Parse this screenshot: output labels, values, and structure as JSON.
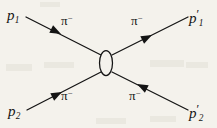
{
  "figure": {
    "kind": "feynman-scattering-diagram",
    "background_color": "#f4f2ec",
    "line_color": "#141414",
    "text_color": "#141414"
  },
  "vertex": {
    "name": "interaction-blob",
    "shape": "ellipse",
    "cx": 106,
    "cy": 63,
    "rx": 6.5,
    "ry": 12.5,
    "fill": "#f4f2ec",
    "stroke": "#141414"
  },
  "momenta": [
    {
      "id": "p1",
      "base": "p",
      "sub": "1",
      "prime": "",
      "position": "upper-left"
    },
    {
      "id": "p1prime",
      "base": "p",
      "sub": "1",
      "prime": "′",
      "position": "upper-right"
    },
    {
      "id": "p2",
      "base": "p",
      "sub": "2",
      "prime": "",
      "position": "lower-left"
    },
    {
      "id": "p2prime",
      "base": "p",
      "sub": "2",
      "prime": "′",
      "position": "lower-right"
    }
  ],
  "particles": [
    {
      "id": "pi-upper-left",
      "symbol": "π",
      "charge": "−",
      "leg": "upper-left",
      "arrow_direction": "toward-vertex"
    },
    {
      "id": "pi-upper-right",
      "symbol": "π",
      "charge": "−",
      "leg": "upper-right",
      "arrow_direction": "away-from-vertex"
    },
    {
      "id": "pi-lower-left",
      "symbol": "π",
      "charge": "−",
      "leg": "lower-left",
      "arrow_direction": "toward-vertex"
    },
    {
      "id": "pi-lower-right",
      "symbol": "π",
      "charge": "−",
      "leg": "lower-right",
      "arrow_direction": "toward-vertex"
    }
  ],
  "legs": [
    {
      "id": "leg-upper-left",
      "x1": 26,
      "y1": 17,
      "x2": 101,
      "y2": 55,
      "arrow_at_x": 57,
      "arrow_at_y": 32,
      "arrow_angle_deg": 27
    },
    {
      "id": "leg-upper-right",
      "x1": 112,
      "y1": 55,
      "x2": 188,
      "y2": 17,
      "arrow_at_x": 147,
      "arrow_at_y": 37,
      "arrow_angle_deg": -27
    },
    {
      "id": "leg-lower-left",
      "x1": 27,
      "y1": 110,
      "x2": 101,
      "y2": 72,
      "arrow_at_x": 58,
      "arrow_at_y": 94,
      "arrow_angle_deg": -27
    },
    {
      "id": "leg-lower-right",
      "x1": 112,
      "y1": 72,
      "x2": 188,
      "y2": 110,
      "arrow_at_x": 142,
      "arrow_at_y": 87,
      "arrow_angle_deg": 207
    }
  ]
}
